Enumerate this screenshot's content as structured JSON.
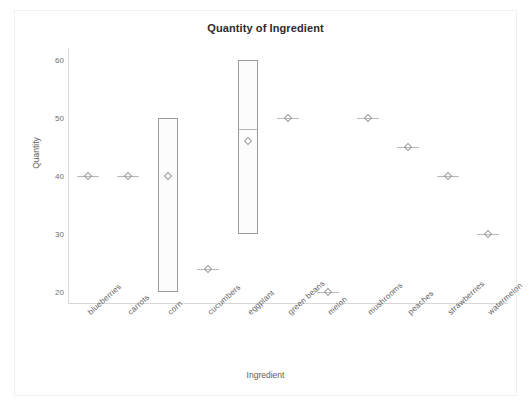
{
  "chart_data": {
    "type": "box",
    "title": "Quantity of Ingredient",
    "xlabel": "Ingredient",
    "ylabel": "Quantity",
    "ylim": [
      18,
      62
    ],
    "yticks": [
      20,
      30,
      40,
      50,
      60
    ],
    "grid": false,
    "legend": "none",
    "categories": [
      "blueberries",
      "carrots",
      "corn",
      "cucumbers",
      "eggplant",
      "green beans",
      "melon",
      "mushrooms",
      "peaches",
      "strawberries",
      "watermelon"
    ],
    "boxes": [
      {
        "category": "blueberries",
        "q1": 40,
        "median": 40,
        "q3": 40,
        "mean": 40,
        "whisker_low": 40,
        "whisker_high": 40,
        "single_value": true
      },
      {
        "category": "carrots",
        "q1": 40,
        "median": 40,
        "q3": 40,
        "mean": 40,
        "whisker_low": 40,
        "whisker_high": 40,
        "single_value": true
      },
      {
        "category": "corn",
        "q1": 20,
        "median": 20,
        "q3": 50,
        "mean": 40,
        "whisker_low": 20,
        "whisker_high": 50,
        "single_value": false
      },
      {
        "category": "cucumbers",
        "q1": 24,
        "median": 24,
        "q3": 24,
        "mean": 24,
        "whisker_low": 24,
        "whisker_high": 24,
        "single_value": true
      },
      {
        "category": "eggplant",
        "q1": 30,
        "median": 48,
        "q3": 60,
        "mean": 46,
        "whisker_low": 30,
        "whisker_high": 60,
        "single_value": false
      },
      {
        "category": "green beans",
        "q1": 50,
        "median": 50,
        "q3": 50,
        "mean": 50,
        "whisker_low": 50,
        "whisker_high": 50,
        "single_value": true
      },
      {
        "category": "melon",
        "q1": 20,
        "median": 20,
        "q3": 20,
        "mean": 20,
        "whisker_low": 20,
        "whisker_high": 20,
        "single_value": true
      },
      {
        "category": "mushrooms",
        "q1": 50,
        "median": 50,
        "q3": 50,
        "mean": 50,
        "whisker_low": 50,
        "whisker_high": 50,
        "single_value": true
      },
      {
        "category": "peaches",
        "q1": 45,
        "median": 45,
        "q3": 45,
        "mean": 45,
        "whisker_low": 45,
        "whisker_high": 45,
        "single_value": true
      },
      {
        "category": "strawberries",
        "q1": 40,
        "median": 40,
        "q3": 40,
        "mean": 40,
        "whisker_low": 40,
        "whisker_high": 40,
        "single_value": true
      },
      {
        "category": "watermelon",
        "q1": 30,
        "median": 30,
        "q3": 30,
        "mean": 30,
        "whisker_low": 30,
        "whisker_high": 30,
        "single_value": true
      }
    ],
    "colors": {
      "box_stroke": "#9a9a9a",
      "box_fill": "#fcfcfc",
      "marker": "#9d9d9d",
      "axis": "#d8d8d8",
      "text": "#5d5d5d",
      "title": "#2b2b2b",
      "background": "#ffffff"
    }
  }
}
